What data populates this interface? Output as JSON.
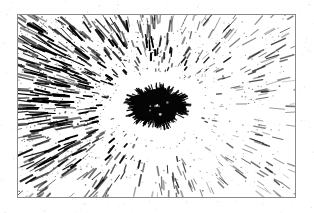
{
  "page": {
    "width": 314,
    "height": 213,
    "background_color": "#ffffff",
    "scan_speckle": true
  },
  "plate": {
    "name": "framed-figure-plate",
    "x": 17,
    "y": 14,
    "width": 279,
    "height": 184,
    "border_color": "#8a8a8a",
    "border_width": 1,
    "background_color": "#ffffff"
  },
  "figure": {
    "title": "",
    "caption": "",
    "ink_color": "#000000",
    "paper_color": "#ffffff",
    "center": {
      "x": 139,
      "y": 91
    },
    "core": {
      "name": "central-dark-nucleus",
      "shape": "ellipse",
      "cx": 139,
      "cy": 91,
      "rx": 26,
      "ry": 17,
      "fill": "#050505",
      "spike_count": 150,
      "spike_min_length": 2,
      "spike_max_length": 9
    },
    "halo": {
      "name": "clear-halo-ring",
      "inner_radius": 30,
      "outer_radius": 58,
      "fill": "#ffffff"
    },
    "rays": {
      "name": "radial-streak-field",
      "count": 2600,
      "inner_radius": 46,
      "outer_radius": 230,
      "min_length": 2,
      "max_length": 22,
      "min_thickness": 0.7,
      "max_thickness": 2.2,
      "density_bias_angle_deg": 200,
      "density_left_right_ratio": 2.1
    },
    "speckle": {
      "name": "halftone-speckle-field",
      "count": 2200,
      "min_size": 0.5,
      "max_size": 1.6
    }
  }
}
